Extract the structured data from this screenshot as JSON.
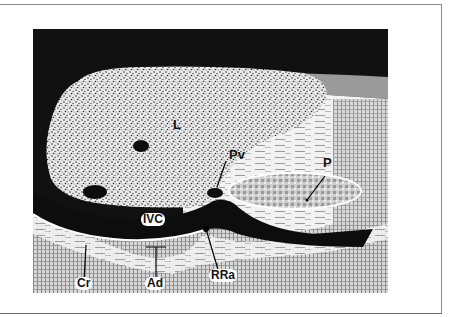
{
  "figure": {
    "labels": {
      "liver": "L",
      "portal_vein": "Pv",
      "pancreas": "P",
      "ivc": "IVC",
      "crus": "Cr",
      "adrenal": "Ad",
      "right_renal_artery": "RRa"
    },
    "colors": {
      "background": "#111111",
      "liver_fill": "#e6e6e6",
      "vessel": "#0d0d0d",
      "tissue": "#cfcfcf",
      "frame": "#8a8a8a"
    }
  }
}
